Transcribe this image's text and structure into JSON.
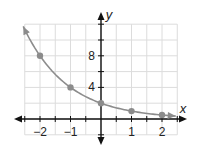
{
  "chart_data": {
    "type": "line",
    "title": "",
    "xlabel": "x",
    "ylabel": "y",
    "xlim": [
      -2.5,
      2.5
    ],
    "ylim": [
      -2,
      12
    ],
    "grid": true,
    "x_ticks": [
      -2,
      -1,
      0,
      1,
      2
    ],
    "x_tick_labels": [
      "−2",
      "−1",
      "",
      "1",
      "2"
    ],
    "y_ticks": [
      4,
      8
    ],
    "y_tick_labels": [
      "4",
      "8"
    ],
    "series": [
      {
        "name": "y = 2(1/2)^x",
        "points": [
          {
            "x": -2,
            "y": 8
          },
          {
            "x": -1,
            "y": 4
          },
          {
            "x": 0,
            "y": 2
          },
          {
            "x": 1,
            "y": 1
          },
          {
            "x": 2,
            "y": 0.5
          }
        ],
        "curve_domain": [
          -2.55,
          2.45
        ],
        "color": "#8c8c8c"
      }
    ],
    "axis_color": "#111111",
    "grid_color": "#dcdcdc"
  }
}
